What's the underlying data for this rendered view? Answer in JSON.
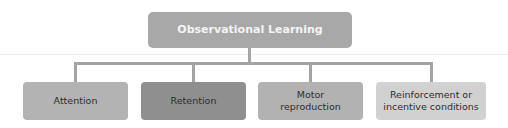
{
  "diagram": {
    "type": "hierarchy",
    "root": {
      "label": "Observational Learning",
      "color": "#a8a8a8"
    },
    "children": [
      {
        "label": "Attention",
        "color": "#b3b3b3"
      },
      {
        "label": "Retention",
        "color": "#8f8f8f"
      },
      {
        "label": "Motor reproduction",
        "color": "#b2b2b2"
      },
      {
        "label": "Reinforcement or incentive conditions",
        "color": "#d1d1d1"
      }
    ],
    "connector_color": "#a4a4a4"
  }
}
